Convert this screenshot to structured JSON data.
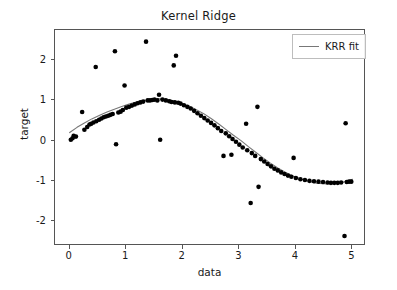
{
  "chart_data": {
    "type": "scatter",
    "title": "Kernel Ridge",
    "xlabel": "data",
    "ylabel": "target",
    "xlim": [
      -0.26,
      5.24
    ],
    "ylim": [
      -2.62,
      2.75
    ],
    "xticks": [
      0,
      1,
      2,
      3,
      4,
      5
    ],
    "xtick_labels": [
      "0",
      "1",
      "2",
      "3",
      "4",
      "5"
    ],
    "yticks": [
      2,
      1,
      0,
      -1,
      -2
    ],
    "ytick_labels": [
      "2",
      "1",
      "0",
      "-1",
      "-2"
    ],
    "grid": false,
    "legend_position": "upper right",
    "series": [
      {
        "name": "data",
        "type": "scatter",
        "marker": "circle",
        "color": "#000000",
        "marker_size": 4.6,
        "points": [
          [
            0.02,
            0.02
          ],
          [
            0.05,
            0.06
          ],
          [
            0.07,
            0.12
          ],
          [
            0.11,
            0.1
          ],
          [
            0.22,
            0.71
          ],
          [
            0.26,
            0.27
          ],
          [
            0.31,
            0.34
          ],
          [
            0.35,
            0.4
          ],
          [
            0.38,
            0.42
          ],
          [
            0.42,
            0.45
          ],
          [
            0.46,
            1.83
          ],
          [
            0.47,
            0.48
          ],
          [
            0.52,
            0.52
          ],
          [
            0.56,
            0.55
          ],
          [
            0.6,
            0.58
          ],
          [
            0.64,
            0.6
          ],
          [
            0.68,
            0.62
          ],
          [
            0.72,
            0.64
          ],
          [
            0.76,
            0.66
          ],
          [
            0.8,
            2.22
          ],
          [
            0.82,
            -0.09
          ],
          [
            0.86,
            0.7
          ],
          [
            0.9,
            0.72
          ],
          [
            0.94,
            0.76
          ],
          [
            0.97,
            1.37
          ],
          [
            1.0,
            0.82
          ],
          [
            1.05,
            0.84
          ],
          [
            1.1,
            0.87
          ],
          [
            1.15,
            0.9
          ],
          [
            1.2,
            0.93
          ],
          [
            1.25,
            0.95
          ],
          [
            1.3,
            0.97
          ],
          [
            1.35,
            2.46
          ],
          [
            1.38,
            1.0
          ],
          [
            1.42,
            1.0
          ],
          [
            1.46,
            1.01
          ],
          [
            1.5,
            1.02
          ],
          [
            1.55,
            1.0
          ],
          [
            1.58,
            1.14
          ],
          [
            1.6,
            0.02
          ],
          [
            1.64,
            1.02
          ],
          [
            1.7,
            1.0
          ],
          [
            1.76,
            0.98
          ],
          [
            1.8,
            0.96
          ],
          [
            1.84,
            1.87
          ],
          [
            1.86,
            0.95
          ],
          [
            1.88,
            2.11
          ],
          [
            1.92,
            0.94
          ],
          [
            1.96,
            0.92
          ],
          [
            2.02,
            0.88
          ],
          [
            2.08,
            0.84
          ],
          [
            2.14,
            0.8
          ],
          [
            2.2,
            0.74
          ],
          [
            2.26,
            0.68
          ],
          [
            2.32,
            0.62
          ],
          [
            2.38,
            0.56
          ],
          [
            2.44,
            0.5
          ],
          [
            2.5,
            0.44
          ],
          [
            2.56,
            0.38
          ],
          [
            2.62,
            0.31
          ],
          [
            2.68,
            0.24
          ],
          [
            2.72,
            -0.38
          ],
          [
            2.76,
            0.18
          ],
          [
            2.82,
            0.11
          ],
          [
            2.86,
            -0.35
          ],
          [
            2.88,
            0.04
          ],
          [
            2.94,
            -0.03
          ],
          [
            3.0,
            -0.1
          ],
          [
            3.06,
            -0.17
          ],
          [
            3.12,
            0.42
          ],
          [
            3.14,
            -0.24
          ],
          [
            3.2,
            -1.55
          ],
          [
            3.22,
            -0.31
          ],
          [
            3.28,
            -0.38
          ],
          [
            3.32,
            0.84
          ],
          [
            3.34,
            -1.15
          ],
          [
            3.38,
            -0.46
          ],
          [
            3.44,
            -0.52
          ],
          [
            3.5,
            -0.58
          ],
          [
            3.56,
            -0.64
          ],
          [
            3.62,
            -0.7
          ],
          [
            3.68,
            -0.74
          ],
          [
            3.74,
            -0.79
          ],
          [
            3.8,
            -0.83
          ],
          [
            3.86,
            -0.87
          ],
          [
            3.92,
            -0.9
          ],
          [
            3.96,
            -0.43
          ],
          [
            4.0,
            -0.93
          ],
          [
            4.08,
            -0.96
          ],
          [
            4.16,
            -0.98
          ],
          [
            4.24,
            -1.0
          ],
          [
            4.32,
            -1.01
          ],
          [
            4.4,
            -1.02
          ],
          [
            4.48,
            -1.03
          ],
          [
            4.56,
            -1.04
          ],
          [
            4.62,
            -1.05
          ],
          [
            4.68,
            -1.05
          ],
          [
            4.74,
            -1.05
          ],
          [
            4.8,
            -1.04
          ],
          [
            4.86,
            -2.37
          ],
          [
            4.88,
            0.43
          ],
          [
            4.9,
            -1.03
          ],
          [
            4.94,
            -1.02
          ],
          [
            4.98,
            -1.02
          ]
        ]
      },
      {
        "name": "KRR fit",
        "type": "line",
        "color": "#777777",
        "linewidth": 1.1,
        "x": [
          0.0,
          0.13,
          0.26,
          0.39,
          0.53,
          0.66,
          0.79,
          0.92,
          1.05,
          1.18,
          1.32,
          1.45,
          1.58,
          1.71,
          1.84,
          1.97,
          2.11,
          2.24,
          2.37,
          2.5,
          2.63,
          2.76,
          2.89,
          3.03,
          3.16,
          3.29,
          3.42,
          3.55,
          3.68,
          3.82,
          3.95,
          4.08,
          4.21,
          4.34,
          4.47,
          4.61,
          4.74,
          4.87,
          5.0
        ],
        "y": [
          0.2,
          0.33,
          0.44,
          0.54,
          0.63,
          0.71,
          0.78,
          0.85,
          0.91,
          0.96,
          1.0,
          1.03,
          1.04,
          1.03,
          0.99,
          0.93,
          0.86,
          0.77,
          0.67,
          0.55,
          0.42,
          0.28,
          0.14,
          0.0,
          -0.15,
          -0.29,
          -0.43,
          -0.56,
          -0.68,
          -0.79,
          -0.88,
          -0.95,
          -1.01,
          -1.05,
          -1.07,
          -1.08,
          -1.06,
          -1.02,
          -0.96
        ]
      }
    ],
    "legend_entries": [
      {
        "label": "KRR fit",
        "color": "#777777",
        "marker": "line"
      }
    ]
  },
  "axes": {
    "title": "Kernel Ridge",
    "xlabel": "data",
    "ylabel": "target"
  },
  "legend": {
    "label": "KRR fit"
  }
}
